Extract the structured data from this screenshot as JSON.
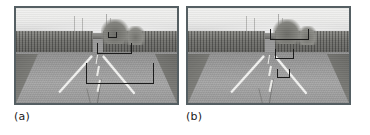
{
  "figure": {
    "type": "two-panel-comparison"
  },
  "panels": [
    {
      "id": "a",
      "caption": "(a)",
      "scene": {
        "content": "straight asphalt road receding to vanishing point, dense tree lines on both sides, overcast sky, distant towers"
      },
      "detections": [
        {
          "name": "detection-bracket-far",
          "left": 57.0,
          "top": 25.0,
          "width": 6.0,
          "height": 7.0
        },
        {
          "name": "detection-bracket-mid",
          "left": 50.0,
          "top": 37.0,
          "width": 22.0,
          "height": 11.0
        },
        {
          "name": "detection-bracket-near",
          "left": 43.5,
          "top": 58.0,
          "width": 42.0,
          "height": 22.0
        }
      ]
    },
    {
      "id": "b",
      "caption": "(b)",
      "scene": {
        "content": "straight asphalt road receding to vanishing point, dense tree lines on both sides, overcast sky, distant towers"
      },
      "detections": [
        {
          "name": "detection-bracket-far",
          "left": 51.0,
          "top": 22.0,
          "width": 24.0,
          "height": 12.0
        },
        {
          "name": "detection-bracket-mid",
          "left": 54.0,
          "top": 43.0,
          "width": 12.0,
          "height": 11.0
        },
        {
          "name": "detection-bracket-near",
          "left": 55.5,
          "top": 64.0,
          "width": 8.0,
          "height": 10.0
        }
      ]
    }
  ],
  "colors": {
    "frame_border": "#555f63",
    "bracket_stroke": "#1c1c1c",
    "road_gray": "#a0a0a0",
    "sky_gray": "#ececeb",
    "treeline_gray": "#6e6e6a",
    "caption_text": "#1a1a1a",
    "page_background": "#ffffff"
  }
}
